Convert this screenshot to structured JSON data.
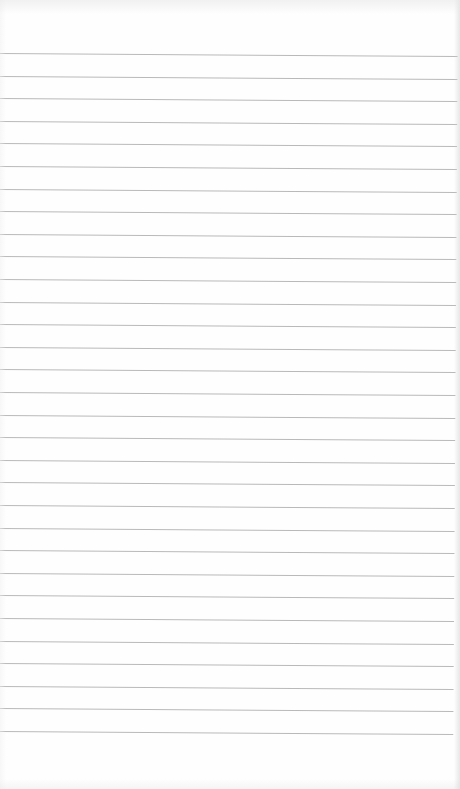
{
  "page": {
    "type": "lined-notebook-paper",
    "width": 460,
    "height": 789,
    "background_color": "#fefefe",
    "line_color": "#b9b9b9",
    "line_count": 31,
    "first_line_y": 53,
    "line_spacing": 22.6,
    "tilt_deg": 0.37,
    "text_content": []
  }
}
